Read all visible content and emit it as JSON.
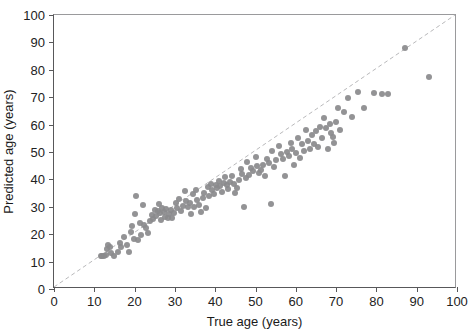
{
  "chart_data": {
    "type": "scatter",
    "title": "",
    "xlabel": "True age (years)",
    "ylabel": "Predicted age (years)",
    "xlim": [
      0,
      100
    ],
    "ylim": [
      0,
      100
    ],
    "xticks": [
      0,
      10,
      20,
      30,
      40,
      50,
      60,
      70,
      80,
      90,
      100
    ],
    "yticks": [
      0,
      10,
      20,
      30,
      40,
      50,
      60,
      70,
      80,
      90,
      100
    ],
    "grid": false,
    "legend": null,
    "point_color": "#8a8a8c",
    "reference_line": {
      "name": "identity-line",
      "style": "dashed",
      "color": "#b9b9bb",
      "from": [
        0,
        0
      ],
      "to": [
        100,
        100
      ]
    },
    "series": [
      {
        "name": "Predicted vs true age",
        "marker": "circle",
        "points": [
          [
            11.6,
            12.2
          ],
          [
            12.0,
            12.1
          ],
          [
            12.4,
            12.2
          ],
          [
            12.8,
            12.3
          ],
          [
            13.2,
            14.6
          ],
          [
            13.5,
            16.1
          ],
          [
            13.9,
            15.3
          ],
          [
            14.2,
            13.0
          ],
          [
            15.0,
            11.9
          ],
          [
            15.8,
            13.5
          ],
          [
            16.4,
            16.9
          ],
          [
            16.7,
            15.5
          ],
          [
            17.3,
            18.9
          ],
          [
            18.1,
            16.2
          ],
          [
            18.5,
            13.6
          ],
          [
            19.0,
            20.8
          ],
          [
            19.4,
            22.9
          ],
          [
            19.8,
            18.4
          ],
          [
            20.1,
            27.3
          ],
          [
            20.4,
            33.9
          ],
          [
            20.9,
            17.9
          ],
          [
            21.3,
            24.1
          ],
          [
            21.6,
            19.7
          ],
          [
            22.1,
            30.5
          ],
          [
            22.4,
            23.4
          ],
          [
            22.9,
            22.1
          ],
          [
            23.4,
            20.5
          ],
          [
            23.8,
            24.9
          ],
          [
            24.2,
            27.1
          ],
          [
            24.6,
            25.6
          ],
          [
            25.0,
            29.0
          ],
          [
            25.3,
            26.8
          ],
          [
            25.7,
            28.4
          ],
          [
            26.0,
            30.9
          ],
          [
            26.3,
            27.8
          ],
          [
            26.6,
            25.3
          ],
          [
            26.9,
            29.6
          ],
          [
            27.2,
            28.2
          ],
          [
            27.5,
            26.4
          ],
          [
            27.9,
            29.1
          ],
          [
            28.2,
            26.0
          ],
          [
            28.6,
            27.4
          ],
          [
            29.0,
            28.8
          ],
          [
            29.3,
            25.9
          ],
          [
            29.8,
            27.6
          ],
          [
            30.2,
            31.4
          ],
          [
            30.6,
            29.5
          ],
          [
            31.0,
            33.0
          ],
          [
            31.5,
            28.6
          ],
          [
            32.0,
            30.3
          ],
          [
            32.4,
            35.7
          ],
          [
            32.8,
            32.2
          ],
          [
            33.3,
            29.9
          ],
          [
            33.7,
            31.5
          ],
          [
            34.0,
            27.2
          ],
          [
            34.4,
            34.6
          ],
          [
            34.8,
            30.1
          ],
          [
            35.2,
            36.0
          ],
          [
            35.6,
            32.5
          ],
          [
            36.0,
            30.8
          ],
          [
            36.5,
            28.1
          ],
          [
            36.9,
            33.3
          ],
          [
            37.3,
            35.2
          ],
          [
            37.7,
            29.4
          ],
          [
            38.1,
            37.1
          ],
          [
            38.5,
            34.1
          ],
          [
            38.9,
            38.4
          ],
          [
            39.3,
            36.3
          ],
          [
            39.7,
            34.7
          ],
          [
            40.1,
            38.0
          ],
          [
            40.5,
            36.9
          ],
          [
            40.9,
            39.5
          ],
          [
            41.3,
            37.5
          ],
          [
            41.7,
            35.4
          ],
          [
            42.1,
            38.8
          ],
          [
            42.5,
            40.7
          ],
          [
            42.9,
            37.9
          ],
          [
            43.3,
            36.4
          ],
          [
            43.7,
            39.1
          ],
          [
            44.1,
            41.3
          ],
          [
            44.6,
            38.3
          ],
          [
            45.0,
            34.9
          ],
          [
            45.4,
            36.7
          ],
          [
            45.9,
            39.8
          ],
          [
            46.3,
            43.9
          ],
          [
            46.7,
            42.0
          ],
          [
            47.2,
            30.0
          ],
          [
            47.6,
            40.4
          ],
          [
            48.0,
            46.5
          ],
          [
            48.5,
            41.7
          ],
          [
            49.0,
            44.2
          ],
          [
            49.5,
            43.0
          ],
          [
            50.0,
            48.0
          ],
          [
            50.4,
            44.8
          ],
          [
            50.9,
            42.4
          ],
          [
            51.4,
            43.6
          ],
          [
            51.9,
            45.2
          ],
          [
            52.4,
            41.1
          ],
          [
            52.9,
            47.6
          ],
          [
            53.4,
            45.9
          ],
          [
            53.8,
            31.0
          ],
          [
            54.2,
            50.3
          ],
          [
            54.7,
            44.5
          ],
          [
            55.2,
            46.9
          ],
          [
            55.8,
            52.2
          ],
          [
            56.3,
            49.1
          ],
          [
            56.8,
            47.3
          ],
          [
            57.3,
            41.4
          ],
          [
            57.8,
            50.0
          ],
          [
            58.2,
            48.5
          ],
          [
            58.7,
            53.4
          ],
          [
            59.1,
            51.0
          ],
          [
            59.6,
            45.3
          ],
          [
            60.0,
            49.6
          ],
          [
            60.5,
            55.2
          ],
          [
            61.0,
            47.8
          ],
          [
            61.5,
            52.8
          ],
          [
            62.0,
            50.5
          ],
          [
            62.5,
            58.0
          ],
          [
            63.0,
            54.0
          ],
          [
            63.5,
            51.2
          ],
          [
            64.0,
            56.3
          ],
          [
            64.5,
            53.1
          ],
          [
            65.0,
            57.5
          ],
          [
            65.5,
            52.0
          ],
          [
            66.0,
            59.2
          ],
          [
            66.5,
            55.0
          ],
          [
            67.0,
            62.3
          ],
          [
            67.5,
            58.6
          ],
          [
            68.0,
            51.0
          ],
          [
            68.4,
            60.2
          ],
          [
            68.8,
            57.0
          ],
          [
            69.2,
            55.4
          ],
          [
            69.6,
            53.2
          ],
          [
            70.0,
            61.0
          ],
          [
            70.5,
            66.2
          ],
          [
            71.0,
            58.1
          ],
          [
            72.0,
            64.5
          ],
          [
            73.0,
            69.8
          ],
          [
            74.0,
            62.8
          ],
          [
            75.5,
            72.0
          ],
          [
            77.0,
            66.0
          ],
          [
            79.5,
            71.5
          ],
          [
            81.5,
            71.3
          ],
          [
            83.0,
            71.2
          ],
          [
            87.0,
            88.0
          ],
          [
            93.0,
            77.2
          ]
        ]
      }
    ]
  },
  "axes": {
    "x_title": "True age (years)",
    "y_title": "Predicted age (years)",
    "x_tick_labels": [
      "0",
      "10",
      "20",
      "30",
      "40",
      "50",
      "60",
      "70",
      "80",
      "90",
      "100"
    ],
    "y_tick_labels": [
      "0",
      "10",
      "20",
      "30",
      "40",
      "50",
      "60",
      "70",
      "80",
      "90",
      "100"
    ]
  }
}
